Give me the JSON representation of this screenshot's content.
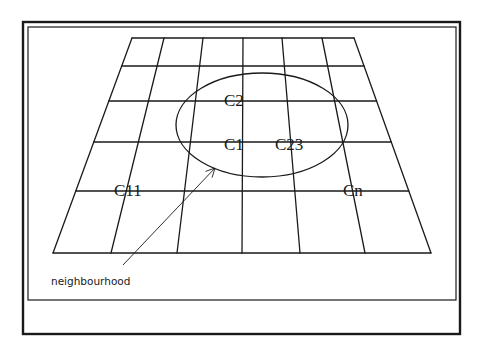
{
  "diagram": {
    "colors": {
      "stroke": "#1a1a1a",
      "background": "#ffffff"
    },
    "frame": {
      "outer": {
        "x": 23,
        "y": 22,
        "width": 437,
        "height": 312
      },
      "inner": {
        "x": 28,
        "y": 27,
        "width": 428,
        "height": 273
      }
    },
    "grid": {
      "rows": 5,
      "cols": 6,
      "top_edge_y": 38,
      "bottom_edge_y": 253,
      "top_vertices_x": [
        132,
        164,
        203,
        243,
        282,
        322,
        354
      ],
      "bottom_vertices_x": [
        53,
        111,
        177,
        242,
        300,
        365,
        431
      ],
      "horizontal_lines_y": [
        38,
        66,
        101,
        142,
        191,
        253
      ]
    },
    "ellipse": {
      "cx": 262,
      "cy": 125,
      "rx": 86,
      "ry": 52
    },
    "cells": [
      {
        "id": "c2",
        "label": "C2",
        "x": 224,
        "y": 106
      },
      {
        "id": "c1",
        "label": "C1",
        "x": 224,
        "y": 150
      },
      {
        "id": "c23",
        "label": "C23",
        "x": 275,
        "y": 150
      },
      {
        "id": "c11",
        "label": "C11",
        "x": 114,
        "y": 196
      },
      {
        "id": "cn",
        "label": "Cn",
        "x": 343,
        "y": 196
      }
    ],
    "annotation": {
      "label": "neighbourhood",
      "x": 51,
      "y": 285,
      "arrow": {
        "from": [
          123,
          265
        ],
        "to": [
          215,
          168
        ]
      }
    }
  }
}
